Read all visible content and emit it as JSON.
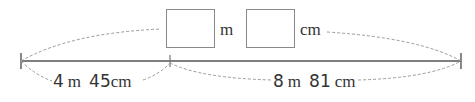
{
  "diagram": {
    "type": "length-addition-bar",
    "answer": {
      "meters_box": "",
      "meters_unit": "m",
      "centimeters_box": "",
      "centimeters_unit": "cm"
    },
    "segments": [
      {
        "meters": "4",
        "m_unit": "m",
        "centimeters": "45",
        "cm_unit": "cm"
      },
      {
        "meters": "8",
        "m_unit": "m",
        "centimeters": "81",
        "cm_unit": "cm"
      }
    ],
    "colors": {
      "line": "#555555",
      "dashed": "#9a9a9a",
      "box_border": "#8a8a8a",
      "text": "#333333"
    }
  }
}
